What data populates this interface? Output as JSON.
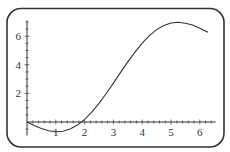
{
  "chart_data": {
    "type": "line",
    "title": "",
    "xlabel": "",
    "ylabel": "",
    "xlim": [
      0,
      6.28
    ],
    "ylim": [
      -1,
      7.5
    ],
    "grid": false,
    "legend": null,
    "x_ticks": [
      "1",
      "2",
      "3",
      "4",
      "5",
      "6"
    ],
    "y_ticks": [
      "2",
      "4",
      "6"
    ],
    "series": [
      {
        "name": "f(x)",
        "x": [
          0,
          0.25,
          0.5,
          0.75,
          1.0,
          1.25,
          1.5,
          1.75,
          2.0,
          2.25,
          2.5,
          2.75,
          3.0,
          3.25,
          3.5,
          3.75,
          4.0,
          4.25,
          4.5,
          4.75,
          5.0,
          5.25,
          5.5,
          5.75,
          6.0,
          6.28
        ],
        "values": [
          0,
          -0.24,
          -0.46,
          -0.61,
          -0.68,
          -0.65,
          -0.49,
          -0.22,
          0.18,
          0.69,
          1.3,
          1.99,
          2.72,
          3.47,
          4.2,
          4.89,
          5.51,
          6.04,
          6.46,
          6.75,
          6.92,
          6.97,
          6.91,
          6.78,
          6.56,
          6.28
        ]
      }
    ],
    "line_color": "#333333",
    "frame_color": "#333333"
  }
}
